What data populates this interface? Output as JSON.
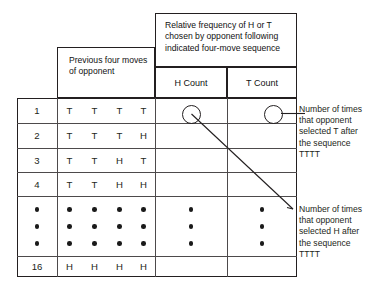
{
  "figure": {
    "headers": {
      "relative_frequency": "Relative frequency of H or T chosen by opponent following indicated four-move sequence",
      "previous_moves": "Previous four moves of opponent",
      "h_count": "H Count",
      "t_count": "T Count"
    },
    "table": {
      "columns": [
        "#",
        "m1",
        "m2",
        "m3",
        "m4",
        "H Count",
        "T Count"
      ],
      "rows": [
        {
          "index": "1",
          "moves": [
            "T",
            "T",
            "T",
            "T"
          ],
          "h_count": "",
          "t_count": ""
        },
        {
          "index": "2",
          "moves": [
            "T",
            "T",
            "T",
            "H"
          ],
          "h_count": "",
          "t_count": ""
        },
        {
          "index": "3",
          "moves": [
            "T",
            "T",
            "H",
            "T"
          ],
          "h_count": "",
          "t_count": ""
        },
        {
          "index": "4",
          "moves": [
            "T",
            "T",
            "H",
            "H"
          ],
          "h_count": "",
          "t_count": ""
        }
      ],
      "ellipsis_rows": 3,
      "last_row": {
        "index": "16",
        "moves": [
          "H",
          "H",
          "H",
          "H"
        ],
        "h_count": "",
        "t_count": ""
      }
    },
    "annotations": [
      {
        "name": "t-count-annotation",
        "lines": [
          "Number of times",
          "that opponent",
          "selected T after",
          "the sequence",
          "TTTT"
        ],
        "text": "Number of times that opponent selected T after the sequence TTTT",
        "target": "T Count"
      },
      {
        "name": "h-count-annotation",
        "lines": [
          "Number of times",
          "that opponent",
          "selected H after",
          "the sequence",
          "TTTT"
        ],
        "text": "Number of times that opponent selected H after the sequence TTTT",
        "target": "H Count"
      }
    ],
    "colors": {
      "line": "#231f20",
      "inner_line": "#4d4a4b",
      "background": "#ffffff",
      "dot": "#1a1a1a"
    }
  }
}
